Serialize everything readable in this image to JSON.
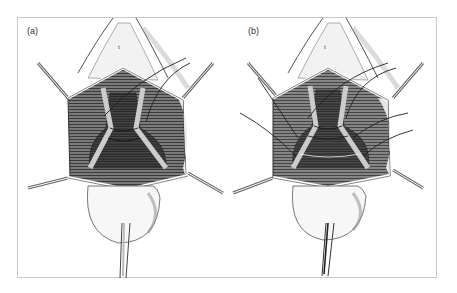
{
  "figure": {
    "panels": [
      {
        "id": "a",
        "label": "(a)",
        "tag": "t",
        "sutures": 2
      },
      {
        "id": "b",
        "label": "(b)",
        "tag": "t",
        "sutures": 6
      }
    ],
    "colors": {
      "frame": "#c8c8c8",
      "ink": "#222222",
      "tissue_dark": "#3a3a3a",
      "tissue_mid": "#8a8a8a",
      "tissue_light": "#d8d8d8",
      "background": "#ffffff"
    }
  }
}
